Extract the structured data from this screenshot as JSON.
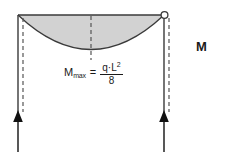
{
  "diagram": {
    "type": "bending-moment-diagram",
    "title_label": "M",
    "formula": {
      "lhs_main": "M",
      "lhs_sub": "max",
      "equals": "=",
      "numerator_q": "q",
      "numerator_dot": "·",
      "numerator_L": "L",
      "numerator_exp": "2",
      "denominator": "8"
    },
    "colors": {
      "fill": "#d2d2d2",
      "stroke": "#3a3a3a",
      "dashed": "#555555",
      "text": "#1a1a1a",
      "background": "#ffffff"
    },
    "geometry": {
      "beam_top_y": 15,
      "left_support_x": 18,
      "right_support_x": 164,
      "parabola_min_y": 57,
      "centerline_x": 91,
      "arrow_tip_y": 112,
      "arrow_base_y": 152
    },
    "elements": {
      "left_support_arrow": "upward-reaction-arrow",
      "right_support_arrow": "upward-reaction-arrow",
      "hinge_marker": "open-circle",
      "centerline": "dashed-vertical-centerline",
      "moment_area": "shaded-parabolic-area"
    }
  }
}
